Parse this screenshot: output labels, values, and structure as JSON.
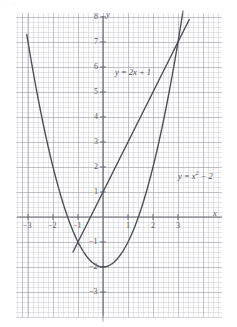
{
  "figure": {
    "corner_mark": "(a)",
    "background_color": "#ffffff",
    "grid_color": "#9a9aa0",
    "curve_color": "#4a4a52",
    "axis_color": "#6b6b72"
  },
  "axes": {
    "x_axis_name": "x",
    "y_axis_name": "y",
    "x_ticks": [
      {
        "value": -3,
        "label": "−3"
      },
      {
        "value": -2,
        "label": "−2"
      },
      {
        "value": -1,
        "label": "−1"
      },
      {
        "value": 1,
        "label": "1"
      },
      {
        "value": 2,
        "label": "2"
      },
      {
        "value": 3,
        "label": "3"
      }
    ],
    "y_ticks": [
      {
        "value": 8,
        "label": "8"
      },
      {
        "value": 7,
        "label": "7"
      },
      {
        "value": 6,
        "label": "6"
      },
      {
        "value": 5,
        "label": "5"
      },
      {
        "value": 4,
        "label": "4"
      },
      {
        "value": 3,
        "label": "3"
      },
      {
        "value": 2,
        "label": "2"
      },
      {
        "value": 1,
        "label": "1"
      },
      {
        "value": -1,
        "label": "−1"
      },
      {
        "value": -2,
        "label": "−2"
      },
      {
        "value": -3,
        "label": "−3"
      }
    ]
  },
  "annotations": {
    "line_label_html": "y = 2x + 1",
    "parabola_label_prefix": "y = x",
    "parabola_label_exponent": "2",
    "parabola_label_suffix": " − 2"
  },
  "chart_data": {
    "type": "line",
    "title": "",
    "xlabel": "x",
    "ylabel": "y",
    "xlim": [
      -3.6,
      4.0
    ],
    "ylim": [
      -3.6,
      8.4
    ],
    "grid": true,
    "grid_major_step": 1,
    "grid_minor_step": 0.2,
    "legend": "inline-annotations",
    "series": [
      {
        "name": "y = 2x + 1",
        "type": "line",
        "equation": "y = 2x + 1",
        "slope": 2,
        "intercept": 1,
        "x_range": [
          -1.2,
          3.45
        ],
        "points": [
          {
            "x": -1.2,
            "y": -1.4
          },
          {
            "x": -1.0,
            "y": -1.0
          },
          {
            "x": -0.5,
            "y": 0.0
          },
          {
            "x": 0.0,
            "y": 1.0
          },
          {
            "x": 1.0,
            "y": 3.0
          },
          {
            "x": 2.0,
            "y": 5.0
          },
          {
            "x": 3.0,
            "y": 7.0
          },
          {
            "x": 3.45,
            "y": 7.9
          }
        ]
      },
      {
        "name": "y = x² − 2",
        "type": "parabola",
        "equation": "y = x^2 - 2",
        "vertex": {
          "x": 0,
          "y": -2
        },
        "x_range": [
          -3.05,
          3.2
        ],
        "points": [
          {
            "x": -3.0,
            "y": 7.0
          },
          {
            "x": -2.5,
            "y": 4.25
          },
          {
            "x": -2.0,
            "y": 2.0
          },
          {
            "x": -1.5,
            "y": 0.25
          },
          {
            "x": -1.0,
            "y": -1.0
          },
          {
            "x": -0.5,
            "y": -1.75
          },
          {
            "x": 0.0,
            "y": -2.0
          },
          {
            "x": 0.5,
            "y": -1.75
          },
          {
            "x": 1.0,
            "y": -1.0
          },
          {
            "x": 1.5,
            "y": 0.25
          },
          {
            "x": 2.0,
            "y": 2.0
          },
          {
            "x": 2.5,
            "y": 4.25
          },
          {
            "x": 3.0,
            "y": 7.0
          },
          {
            "x": 3.1,
            "y": 7.61
          }
        ]
      }
    ],
    "intersections": [
      {
        "x": -1,
        "y": -1
      },
      {
        "x": 3,
        "y": 7
      }
    ],
    "annotations": [
      {
        "text": "y = 2x + 1",
        "x": 0.45,
        "y": 6.0
      },
      {
        "text": "y = x² − 2",
        "x": 2.4,
        "y": 2.2
      }
    ]
  }
}
